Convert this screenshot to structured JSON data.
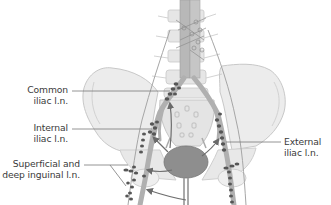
{
  "figure": {
    "labels": {
      "common_iliac": [
        "Common",
        "iliac l.n."
      ],
      "internal_iliac": [
        "Internal",
        "iliac l.n."
      ],
      "superficial_deep_inguinal": [
        "Superficial and",
        "deep inguinal l.n."
      ],
      "external_iliac": [
        "External",
        "iliac l.n."
      ]
    },
    "colors": {
      "bone_fill": "#ececec",
      "bone_stroke": "#c4c4c4",
      "vessel": "#a8a8a8",
      "node": "#555555",
      "bladder": "#8a8a8a",
      "arrow": "#6e6e6e",
      "leader_line": "#7a7a7a",
      "text": "#3a3a3a"
    }
  }
}
